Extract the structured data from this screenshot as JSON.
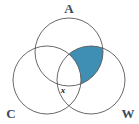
{
  "figure": {
    "background_color": "#ffffff",
    "stroke_color": "#58585c",
    "shade_color": "#3f8fb4",
    "label_color": "#3a4a5a"
  },
  "sets": [
    {
      "id": "A",
      "label": "A",
      "position": "top",
      "cx": 69,
      "cy": 52,
      "r": 34
    },
    {
      "id": "C",
      "label": "C",
      "position": "bottom-left",
      "cx": 47,
      "cy": 80,
      "r": 34
    },
    {
      "id": "W",
      "label": "W",
      "position": "bottom-right",
      "cx": 91,
      "cy": 80,
      "r": 34
    }
  ],
  "labels": {
    "a": "A",
    "c": "C",
    "w": "W",
    "point_x": "x"
  },
  "shaded_region": {
    "description": "A intersect W, excluding C",
    "color": "#3f8fb4",
    "sets_included": "A, W",
    "sets_excluded": "C"
  },
  "marked_point": {
    "label": "x",
    "x": 63,
    "y": 90
  }
}
